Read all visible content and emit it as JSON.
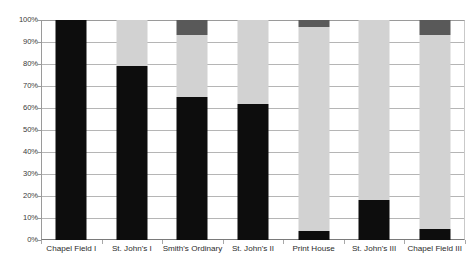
{
  "chart_data": {
    "type": "bar",
    "subtype": "stacked-bar-100-percent",
    "title": "",
    "subtitle": "",
    "xlabel": "",
    "ylabel": "",
    "ylim": [
      0,
      100
    ],
    "y_tick_labels": [
      "0%",
      "10%",
      "20%",
      "30%",
      "40%",
      "50%",
      "60%",
      "70%",
      "80%",
      "90%",
      "100%"
    ],
    "y_tick_values": [
      0,
      10,
      20,
      30,
      40,
      50,
      60,
      70,
      80,
      90,
      100
    ],
    "grid": true,
    "legend": "none",
    "categories": [
      "Chapel Field I",
      "St. John's I",
      "Smith's Ordinary",
      "St. John's  II",
      "Print House",
      "St. John's III",
      "Chapel Field III"
    ],
    "series": [
      {
        "name": "series-1-black",
        "color": "#0d0d0d",
        "values": [
          100,
          79,
          65,
          62,
          4,
          18,
          5
        ]
      },
      {
        "name": "series-2-light-gray",
        "color": "#d2d2d2",
        "values": [
          0,
          21,
          28,
          38,
          93,
          82,
          88
        ]
      },
      {
        "name": "series-3-dark-gray",
        "color": "#595959",
        "values": [
          0,
          0,
          7,
          0,
          3,
          0,
          7
        ]
      }
    ]
  },
  "colors": {
    "series_1": "#0d0d0d",
    "series_2": "#d2d2d2",
    "series_3": "#595959",
    "gridline": "#b5b5b5",
    "axis": "#9a9a9a",
    "background": "#ffffff",
    "tick_text": "#2b2b2b"
  }
}
